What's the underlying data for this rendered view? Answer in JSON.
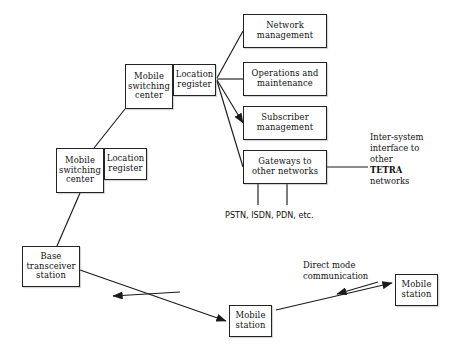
{
  "diagram": {
    "colors": {
      "background": "#ffffff",
      "stroke": "#232323",
      "text": "#101010",
      "shadow": "#787878"
    },
    "nodes": [
      {
        "id": "network-management",
        "label": "Network\nmanagement",
        "x": 243,
        "y": 14,
        "w": 84,
        "h": 34
      },
      {
        "id": "operations-maintenance",
        "label": "Operations and\nmaintenance",
        "x": 243,
        "y": 62,
        "w": 84,
        "h": 34
      },
      {
        "id": "subscriber-management",
        "label": "Subscriber\nmanagement",
        "x": 243,
        "y": 106,
        "w": 84,
        "h": 34
      },
      {
        "id": "gateways-other-networks",
        "label": "Gateways to\nother networks",
        "x": 243,
        "y": 150,
        "w": 84,
        "h": 34
      },
      {
        "id": "mobile-switching-center-top",
        "label": "Mobile\nswitching\ncenter",
        "x": 125,
        "y": 64,
        "w": 48,
        "h": 45
      },
      {
        "id": "location-register-top",
        "label": "Location\nregister",
        "x": 173,
        "y": 64,
        "w": 43,
        "h": 32
      },
      {
        "id": "mobile-switching-center-bottom",
        "label": "Mobile\nswitching\ncenter",
        "x": 56,
        "y": 148,
        "w": 48,
        "h": 45
      },
      {
        "id": "location-register-bottom",
        "label": "Location\nregister",
        "x": 104,
        "y": 148,
        "w": 43,
        "h": 32
      },
      {
        "id": "base-transceiver-station",
        "label": "Base\ntransceiver\nstation",
        "x": 22,
        "y": 246,
        "w": 58,
        "h": 41
      },
      {
        "id": "mobile-station-center",
        "label": "Mobile\nstation",
        "x": 229,
        "y": 305,
        "w": 43,
        "h": 32
      },
      {
        "id": "mobile-station-right",
        "label": "Mobile\nstation",
        "x": 395,
        "y": 274,
        "w": 43,
        "h": 32
      }
    ],
    "labels": [
      {
        "id": "inter-system-interface",
        "text": "Inter-system\ninterface to\nother\nTETRA\nnetworks",
        "bold_line": "TETRA",
        "x": 370,
        "y": 132,
        "style": "serif"
      },
      {
        "id": "external-networks",
        "text": "PSTN, ISDN, PDN, etc.",
        "x": 225,
        "y": 210,
        "style": "sans"
      },
      {
        "id": "direct-mode-communication",
        "text": "Direct mode\ncommunication",
        "x": 303,
        "y": 260,
        "style": "serif"
      }
    ],
    "edges": [
      {
        "id": "location-register-to-network-management",
        "from": "location-register-top",
        "to": "network-management",
        "type": "line",
        "points": "217,78 243,31"
      },
      {
        "id": "location-register-to-operations-maintenance",
        "from": "location-register-top",
        "to": "operations-maintenance",
        "type": "line",
        "points": "217,79 243,79"
      },
      {
        "id": "location-register-to-subscriber-management",
        "from": "location-register-top",
        "to": "subscriber-management",
        "type": "arrow",
        "points": "217,80 243,123"
      },
      {
        "id": "location-register-to-gateways",
        "from": "location-register-top",
        "to": "gateways-other-networks",
        "type": "line",
        "points": "217,81 243,167"
      },
      {
        "id": "gateways-to-inter-system-interface",
        "from": "gateways-other-networks",
        "to": "inter-system-interface",
        "type": "line",
        "points": "327,167 368,167"
      },
      {
        "id": "gateways-to-external-networks-left",
        "from": "gateways-other-networks",
        "to": "external-networks",
        "type": "line",
        "points": "258,184 258,205"
      },
      {
        "id": "gateways-to-external-networks-right",
        "from": "gateways-other-networks",
        "to": "external-networks",
        "type": "line",
        "points": "287,184 287,205"
      },
      {
        "id": "msc-bottom-to-msc-top",
        "from": "mobile-switching-center-bottom",
        "to": "mobile-switching-center-top",
        "type": "line",
        "points": "94,148 125,109"
      },
      {
        "id": "msc-bottom-to-base-transceiver-station",
        "from": "mobile-switching-center-bottom",
        "to": "base-transceiver-station",
        "type": "line",
        "points": "80,193 57,246"
      },
      {
        "id": "base-station-to-mobile-station-downlink",
        "from": "base-transceiver-station",
        "to": "mobile-station-center",
        "type": "arrow",
        "points": "80,270 226,321"
      },
      {
        "id": "base-station-to-mobile-station-uplink",
        "from": "mobile-station-center",
        "to": "base-transceiver-station",
        "type": "arrow",
        "points": "180,292 113,296"
      },
      {
        "id": "mobile-station-to-mobile-station-forward",
        "from": "mobile-station-center",
        "to": "mobile-station-right",
        "type": "arrow",
        "points": "276,310 392,283"
      },
      {
        "id": "mobile-station-to-mobile-station-reverse",
        "from": "mobile-station-right",
        "to": "mobile-station-center",
        "type": "arrow",
        "points": "378,282 337,294"
      }
    ]
  }
}
